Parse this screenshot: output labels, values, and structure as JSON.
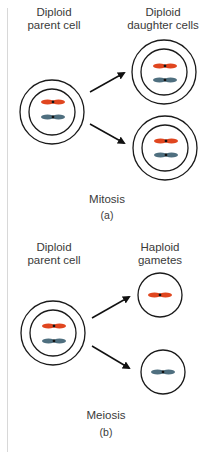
{
  "panels": [
    {
      "id": "a",
      "parent_label_line1": "Diploid",
      "parent_label_line2": "parent cell",
      "product_label_line1": "Diploid",
      "product_label_line2": "daughter cells",
      "process": "Mitosis",
      "sub_label": "(a)"
    },
    {
      "id": "b",
      "parent_label_line1": "Diploid",
      "parent_label_line2": "parent cell",
      "product_label_line1": "Haploid",
      "product_label_line2": "gametes",
      "process": "Meiosis",
      "sub_label": "(b)"
    }
  ],
  "colors": {
    "chromosome_red": "#e0461f",
    "chromosome_blue": "#4f6f7f",
    "outline": "#1a1a1a",
    "arrow": "#111111"
  }
}
